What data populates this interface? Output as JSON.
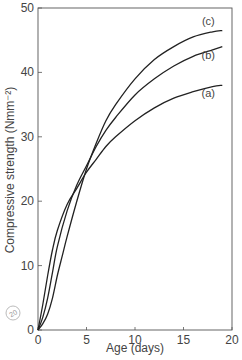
{
  "chart_data": {
    "type": "line",
    "title": "",
    "xlabel": "Age (days)",
    "ylabel": "Compressive strength (Nmm⁻²)",
    "xlim": [
      0,
      20
    ],
    "ylim": [
      0,
      50
    ],
    "xticks": [
      0,
      5,
      10,
      15,
      20
    ],
    "yticks": [
      0,
      10,
      20,
      30,
      40,
      50
    ],
    "grid": false,
    "legend_position": "inline labels at right end of curves",
    "series": [
      {
        "name": "(a)",
        "x": [
          0,
          0.5,
          1,
          1.5,
          2,
          3,
          4,
          5,
          6,
          7,
          8,
          10,
          12,
          14,
          16,
          18,
          19
        ],
        "y": [
          0,
          4,
          8.5,
          12.5,
          15.5,
          19.5,
          22,
          24.5,
          26.5,
          28.5,
          30,
          32.5,
          34.5,
          36,
          37,
          37.8,
          38
        ]
      },
      {
        "name": "(b)",
        "x": [
          0,
          0.5,
          1,
          1.5,
          2,
          3,
          4,
          5,
          6,
          7,
          8,
          10,
          12,
          14,
          16,
          18,
          19
        ],
        "y": [
          0,
          2,
          5,
          9,
          13,
          18.5,
          22.5,
          25.5,
          28.5,
          31,
          33,
          36.5,
          39,
          41,
          42.5,
          43.5,
          44
        ]
      },
      {
        "name": "(c)",
        "x": [
          0,
          0.5,
          1,
          1.5,
          2,
          2.5,
          3,
          4,
          5,
          6,
          7,
          8,
          10,
          12,
          14,
          16,
          18,
          19
        ],
        "y": [
          0,
          1,
          2.5,
          5,
          8.5,
          11.5,
          14.5,
          20,
          25,
          29,
          32.5,
          35,
          39,
          42,
          44,
          45.5,
          46.3,
          46.5
        ]
      }
    ],
    "annotations": [
      "(a)",
      "(b)",
      "(c)"
    ]
  },
  "axes": {
    "x_tick_labels": [
      "0",
      "5",
      "10",
      "15",
      "20"
    ],
    "y_tick_labels": [
      "0",
      "10",
      "20",
      "30",
      "40",
      "50"
    ],
    "xlabel": "Age (days)",
    "ylabel": "Compressive strength (Nmm⁻²)"
  },
  "stamp": {
    "label": "20"
  },
  "colors": {
    "curve": "#222222",
    "axis": "#555555",
    "text": "#444444"
  }
}
